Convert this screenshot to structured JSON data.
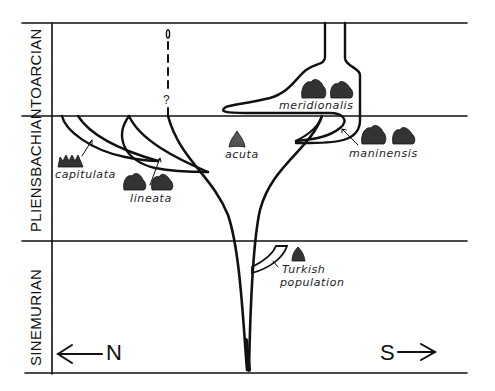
{
  "figure": {
    "stages": [
      {
        "name": "TOARCIAN"
      },
      {
        "name": "PLIENSBACHIAN"
      },
      {
        "name": "SINEMURIAN"
      }
    ],
    "directions": {
      "north": "N",
      "south": "S"
    },
    "taxa": {
      "capitulata": "capitulata",
      "lineata": "lineata",
      "acuta": "acuta",
      "meridionalis": "meridionalis",
      "maninensis": "maninensis",
      "turkish_line1": "Turkish",
      "turkish_line2": "population"
    },
    "uncertain_marker": "?",
    "colors": {
      "ink": "#111111",
      "background": "#ffffff"
    }
  }
}
